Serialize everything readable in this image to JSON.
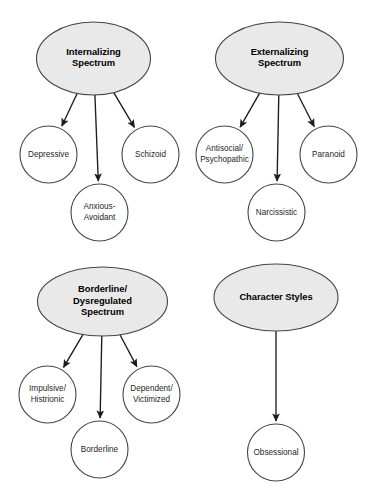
{
  "diagram": {
    "background_color": "#ffffff",
    "parent_fill_color": "#e9e9e9",
    "child_fill_color": "#ffffff",
    "stroke_color": "#454545",
    "edge_color": "#1c1c1c",
    "groups": [
      {
        "id": "internalizing",
        "parent": {
          "name": "internalizing-spectrum",
          "lines": [
            "Internalizing",
            "Spectrum"
          ],
          "cx": 93.5,
          "cy": 58.5,
          "rx": 57,
          "ry": 36.5
        },
        "children": [
          {
            "name": "depressive",
            "lines": [
              "Depressive"
            ],
            "cx": 48.5,
            "cy": 154.5,
            "r": 28.5
          },
          {
            "name": "anxious-avoidant",
            "lines": [
              "Anxious-",
              "Avoidant"
            ],
            "cx": 99.5,
            "cy": 212.5,
            "r": 28.5
          },
          {
            "name": "schizoid",
            "lines": [
              "Schizoid"
            ],
            "cx": 150.5,
            "cy": 154.5,
            "r": 28.5
          }
        ]
      },
      {
        "id": "externalizing",
        "parent": {
          "name": "externalizing-spectrum",
          "lines": [
            "Externalizing",
            "Spectrum"
          ],
          "cx": 279.5,
          "cy": 58.5,
          "rx": 64,
          "ry": 36.5
        },
        "children": [
          {
            "name": "antisocial-psychopathic",
            "lines": [
              "Antisocial/",
              "Psychopathic"
            ],
            "cx": 224.5,
            "cy": 154.5,
            "r": 28.5
          },
          {
            "name": "narcissistic",
            "lines": [
              "Narcissistic"
            ],
            "cx": 276.5,
            "cy": 212.5,
            "r": 28.5
          },
          {
            "name": "paranoid",
            "lines": [
              "Paranoid"
            ],
            "cx": 328.5,
            "cy": 154.5,
            "r": 28.5
          }
        ]
      },
      {
        "id": "borderline-dysregulated",
        "parent": {
          "name": "borderline-dysregulated-spectrum",
          "lines": [
            "Borderline/",
            "Dysregulated",
            "Spectrum"
          ],
          "cx": 102.5,
          "cy": 301.5,
          "rx": 65,
          "ry": 34.5
        },
        "children": [
          {
            "name": "impulsive-histrionic",
            "lines": [
              "Impulsive/",
              "Histrionic"
            ],
            "cx": 47.5,
            "cy": 394.5,
            "r": 28.5
          },
          {
            "name": "borderline",
            "lines": [
              "Borderline"
            ],
            "cx": 99.5,
            "cy": 449.5,
            "r": 28.5
          },
          {
            "name": "dependent-victimized",
            "lines": [
              "Dependent/",
              "Victimized"
            ],
            "cx": 151.5,
            "cy": 394.5,
            "r": 28.5
          }
        ]
      },
      {
        "id": "character-styles",
        "parent": {
          "name": "character-styles",
          "lines": [
            "Character Styles"
          ],
          "cx": 276.0,
          "cy": 297.5,
          "rx": 62,
          "ry": 33.5
        },
        "children": [
          {
            "name": "obsessional",
            "lines": [
              "Obsessional"
            ],
            "cx": 276.0,
            "cy": 452.5,
            "r": 28.5
          }
        ]
      }
    ]
  }
}
